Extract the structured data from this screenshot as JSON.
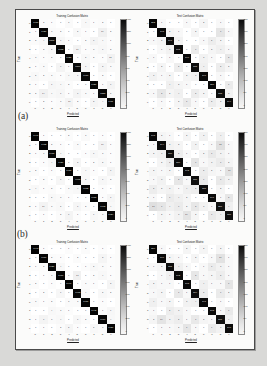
{
  "figure": {
    "panel_labels": [
      "(a)",
      "(b)"
    ],
    "colormap": "greys-reversed",
    "frame_color": "#4a4a4a",
    "page_background": "#d9d9d7",
    "paper_background": "#fbfbfa"
  },
  "titles": {
    "train": "Training Confusion Matrix",
    "test": "Test Confusion Matrix"
  },
  "axes": {
    "xlabel": "Predicted",
    "ylabel": "True",
    "tick_labels": [
      "0",
      "1",
      "2",
      "3",
      "4",
      "5",
      "6",
      "7",
      "8",
      "9"
    ]
  },
  "colorbar": {
    "train_ticks": [
      "1400",
      "1200",
      "1000",
      "800",
      "600",
      "400",
      "200",
      "0"
    ],
    "test_ticks": [
      "350",
      "300",
      "250",
      "200",
      "150",
      "100",
      "50",
      "0"
    ]
  },
  "chart_data": [
    {
      "type": "heatmap",
      "title": "Training Confusion Matrix",
      "panel": "top",
      "side": "train",
      "xlabel": "Predicted",
      "ylabel": "True",
      "categories": [
        "0",
        "1",
        "2",
        "3",
        "4",
        "5",
        "6",
        "7",
        "8",
        "9"
      ],
      "zlim": [
        0,
        1450
      ],
      "values": [
        [
          1437,
          2,
          1,
          0,
          3,
          0,
          4,
          1,
          2,
          0
        ],
        [
          1,
          1420,
          3,
          2,
          0,
          5,
          1,
          0,
          16,
          2
        ],
        [
          2,
          4,
          1398,
          6,
          1,
          0,
          2,
          9,
          4,
          1
        ],
        [
          0,
          2,
          5,
          1412,
          0,
          11,
          1,
          3,
          6,
          2
        ],
        [
          3,
          1,
          2,
          0,
          1425,
          0,
          5,
          2,
          1,
          12
        ],
        [
          1,
          3,
          0,
          9,
          1,
          1390,
          7,
          0,
          8,
          3
        ],
        [
          5,
          2,
          3,
          1,
          4,
          6,
          1419,
          0,
          2,
          0
        ],
        [
          1,
          0,
          7,
          4,
          2,
          0,
          0,
          1426,
          1,
          9
        ],
        [
          2,
          14,
          4,
          7,
          1,
          9,
          3,
          1,
          1388,
          5
        ],
        [
          0,
          2,
          1,
          3,
          11,
          2,
          0,
          8,
          4,
          1411
        ]
      ]
    },
    {
      "type": "heatmap",
      "title": "Test Confusion Matrix",
      "panel": "top",
      "side": "test",
      "xlabel": "Predicted",
      "ylabel": "True",
      "categories": [
        "0",
        "1",
        "2",
        "3",
        "4",
        "5",
        "6",
        "7",
        "8",
        "9"
      ],
      "zlim": [
        0,
        360
      ],
      "values": [
        [
          352,
          1,
          0,
          0,
          1,
          0,
          2,
          0,
          1,
          0
        ],
        [
          0,
          348,
          2,
          1,
          0,
          2,
          0,
          0,
          9,
          1
        ],
        [
          1,
          2,
          341,
          3,
          0,
          0,
          1,
          5,
          2,
          0
        ],
        [
          0,
          1,
          3,
          345,
          0,
          6,
          0,
          2,
          4,
          1
        ],
        [
          1,
          0,
          1,
          0,
          349,
          0,
          3,
          1,
          0,
          8
        ],
        [
          0,
          2,
          0,
          5,
          0,
          338,
          4,
          0,
          5,
          2
        ],
        [
          3,
          1,
          2,
          0,
          2,
          3,
          346,
          0,
          1,
          0
        ],
        [
          0,
          0,
          4,
          2,
          1,
          0,
          0,
          350,
          0,
          6
        ],
        [
          1,
          8,
          2,
          4,
          0,
          5,
          2,
          0,
          335,
          3
        ],
        [
          0,
          1,
          0,
          2,
          7,
          1,
          0,
          5,
          2,
          344
        ]
      ]
    },
    {
      "type": "heatmap",
      "title": "Training Confusion Matrix",
      "panel": "(a)",
      "side": "train",
      "xlabel": "Predicted",
      "ylabel": "True",
      "categories": [
        "0",
        "1",
        "2",
        "3",
        "4",
        "5",
        "6",
        "7",
        "8",
        "9"
      ],
      "zlim": [
        0,
        1450
      ],
      "values": [
        [
          1441,
          1,
          0,
          0,
          2,
          0,
          3,
          0,
          1,
          0
        ],
        [
          0,
          1432,
          2,
          1,
          0,
          3,
          0,
          0,
          10,
          1
        ],
        [
          1,
          3,
          1415,
          4,
          0,
          0,
          1,
          6,
          3,
          1
        ],
        [
          0,
          1,
          4,
          1426,
          0,
          8,
          0,
          2,
          5,
          1
        ],
        [
          2,
          0,
          1,
          0,
          1438,
          0,
          4,
          1,
          0,
          9
        ],
        [
          0,
          2,
          0,
          7,
          0,
          1405,
          5,
          0,
          6,
          2
        ],
        [
          4,
          1,
          2,
          0,
          3,
          4,
          1432,
          0,
          1,
          0
        ],
        [
          0,
          0,
          5,
          3,
          1,
          0,
          0,
          1438,
          1,
          7
        ],
        [
          1,
          11,
          3,
          5,
          0,
          7,
          2,
          0,
          1402,
          4
        ],
        [
          0,
          1,
          0,
          2,
          9,
          1,
          0,
          6,
          3,
          1424
        ]
      ]
    },
    {
      "type": "heatmap",
      "title": "Test Confusion Matrix",
      "panel": "(a)",
      "side": "test",
      "xlabel": "Predicted",
      "ylabel": "True",
      "categories": [
        "0",
        "1",
        "2",
        "3",
        "4",
        "5",
        "6",
        "7",
        "8",
        "9"
      ],
      "zlim": [
        0,
        360
      ],
      "values": [
        [
          348,
          2,
          1,
          0,
          2,
          0,
          3,
          0,
          4,
          0
        ],
        [
          1,
          344,
          3,
          2,
          0,
          3,
          0,
          1,
          12,
          1
        ],
        [
          2,
          3,
          336,
          5,
          1,
          0,
          2,
          7,
          3,
          1
        ],
        [
          0,
          2,
          5,
          339,
          0,
          9,
          1,
          3,
          6,
          2
        ],
        [
          2,
          1,
          2,
          0,
          342,
          0,
          5,
          2,
          1,
          11
        ],
        [
          1,
          3,
          0,
          8,
          1,
          330,
          6,
          0,
          7,
          3
        ],
        [
          5,
          2,
          3,
          1,
          4,
          5,
          337,
          0,
          2,
          0
        ],
        [
          1,
          0,
          6,
          4,
          2,
          0,
          0,
          341,
          1,
          8
        ],
        [
          13,
          9,
          4,
          6,
          2,
          8,
          3,
          1,
          327,
          4
        ],
        [
          0,
          2,
          1,
          3,
          10,
          2,
          0,
          7,
          4,
          336
        ]
      ]
    },
    {
      "type": "heatmap",
      "title": "Training Confusion Matrix",
      "panel": "(b)",
      "side": "train",
      "xlabel": "Predicted",
      "ylabel": "True",
      "categories": [
        "0",
        "1",
        "2",
        "3",
        "4",
        "5",
        "6",
        "7",
        "8",
        "9"
      ],
      "zlim": [
        0,
        1450
      ],
      "values": [
        [
          1443,
          1,
          0,
          0,
          1,
          0,
          2,
          0,
          1,
          0
        ],
        [
          0,
          1436,
          2,
          1,
          0,
          2,
          0,
          0,
          8,
          1
        ],
        [
          1,
          2,
          1421,
          4,
          0,
          0,
          1,
          5,
          3,
          1
        ],
        [
          0,
          1,
          3,
          1430,
          0,
          13,
          0,
          2,
          4,
          1
        ],
        [
          2,
          0,
          1,
          0,
          1440,
          0,
          3,
          1,
          0,
          8
        ],
        [
          0,
          2,
          0,
          6,
          0,
          1412,
          4,
          0,
          5,
          2
        ],
        [
          3,
          1,
          2,
          0,
          3,
          3,
          1437,
          0,
          1,
          0
        ],
        [
          0,
          0,
          4,
          3,
          1,
          0,
          0,
          1442,
          1,
          6
        ],
        [
          1,
          9,
          3,
          4,
          0,
          6,
          2,
          0,
          1410,
          4
        ],
        [
          0,
          1,
          0,
          2,
          8,
          1,
          0,
          5,
          3,
          1429
        ]
      ]
    },
    {
      "type": "heatmap",
      "title": "Test Confusion Matrix",
      "panel": "(b)",
      "side": "test",
      "xlabel": "Predicted",
      "ylabel": "True",
      "categories": [
        "0",
        "1",
        "2",
        "3",
        "4",
        "5",
        "6",
        "7",
        "8",
        "9"
      ],
      "zlim": [
        0,
        360
      ],
      "values": [
        [
          350,
          1,
          0,
          0,
          2,
          0,
          2,
          0,
          2,
          0
        ],
        [
          0,
          346,
          2,
          1,
          0,
          2,
          0,
          1,
          11,
          1
        ],
        [
          1,
          2,
          338,
          4,
          1,
          0,
          1,
          6,
          3,
          1
        ],
        [
          0,
          1,
          4,
          342,
          0,
          8,
          1,
          2,
          5,
          1
        ],
        [
          2,
          1,
          1,
          0,
          345,
          0,
          4,
          1,
          1,
          9
        ],
        [
          1,
          2,
          0,
          7,
          1,
          334,
          5,
          0,
          6,
          2
        ],
        [
          4,
          1,
          2,
          0,
          3,
          4,
          341,
          0,
          1,
          0
        ],
        [
          1,
          0,
          5,
          3,
          1,
          0,
          0,
          345,
          1,
          7
        ],
        [
          2,
          10,
          3,
          5,
          1,
          7,
          2,
          1,
          331,
          4
        ],
        [
          0,
          1,
          1,
          2,
          9,
          1,
          0,
          6,
          3,
          340
        ]
      ]
    }
  ]
}
